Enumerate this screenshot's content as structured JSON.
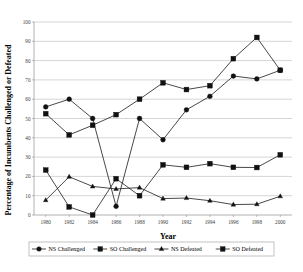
{
  "chart_data": {
    "type": "line",
    "title": "",
    "xlabel": "Year",
    "ylabel": "Percentage of Incumbents Challenged or Defeated",
    "categories": [
      1980,
      1982,
      1984,
      1986,
      1988,
      1990,
      1992,
      1994,
      1996,
      1998,
      2000
    ],
    "xlim": [
      1979,
      2001
    ],
    "ylim": [
      0,
      100
    ],
    "ytick_step": 10,
    "yticks": [
      0,
      10,
      20,
      30,
      40,
      50,
      60,
      70,
      80,
      90,
      100
    ],
    "xticks": [
      "1980",
      "1982",
      "1984",
      "1986",
      "1988",
      "1990",
      "1992",
      "1994",
      "1996",
      "1998",
      "2000"
    ],
    "grid": "horizontal",
    "legend_position": "bottom",
    "series": [
      {
        "name": "NS Challenged",
        "marker": "circle",
        "values": [
          56.0,
          60.0,
          50.0,
          4.5,
          50.0,
          39.0,
          54.5,
          61.5,
          72.0,
          70.5,
          75.0
        ]
      },
      {
        "name": "SO Challenged",
        "marker": "square",
        "values": [
          52.5,
          41.5,
          46.5,
          52.0,
          60.0,
          68.5,
          65.0,
          67.0,
          81.0,
          92.0,
          75.0
        ]
      },
      {
        "name": "NS Defeated",
        "marker": "triangle",
        "values": [
          7.7,
          19.8,
          14.8,
          13.5,
          14.2,
          8.5,
          8.8,
          7.4,
          5.4,
          5.6,
          9.7
        ]
      },
      {
        "name": "SO Defeated",
        "marker": "square",
        "values": [
          23.3,
          4.2,
          0.0,
          18.8,
          10.0,
          26.0,
          24.7,
          26.6,
          24.7,
          24.6,
          31.2
        ]
      }
    ]
  },
  "legend": {
    "items": [
      {
        "label": "NS Challenged",
        "marker": "circle"
      },
      {
        "label": "SO Challenged",
        "marker": "square"
      },
      {
        "label": "NS Defeated",
        "marker": "triangle"
      },
      {
        "label": "SO Defeated",
        "marker": "square"
      }
    ]
  },
  "colors": {
    "series": "#111111",
    "gridline": "#b9b9b9",
    "axis": "#8f8f8f",
    "text": "#000000",
    "background": "#ffffff"
  }
}
